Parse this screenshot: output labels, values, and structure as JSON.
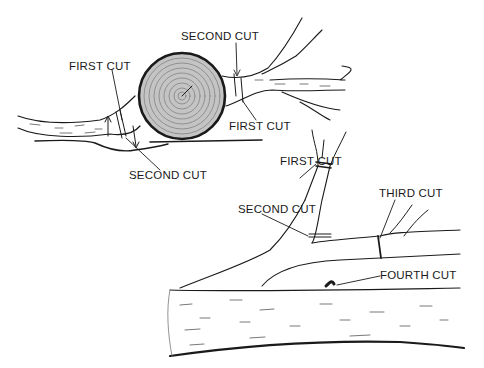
{
  "figure": {
    "top_diagram": {
      "labels": {
        "first_cut_left": "FIRST CUT",
        "second_cut_top": "SECOND CUT",
        "first_cut_right": "FIRST CUT",
        "second_cut_bottom": "SECOND CUT"
      }
    },
    "bottom_diagram": {
      "labels": {
        "first_cut": "FIRST CUT",
        "second_cut": "SECOND CUT",
        "third_cut": "THIRD CUT",
        "fourth_cut": "FOURTH CUT"
      }
    },
    "colors": {
      "ink": "#1a1a1a",
      "paper": "#ffffff",
      "log_fill": "#b8b8b8"
    }
  }
}
